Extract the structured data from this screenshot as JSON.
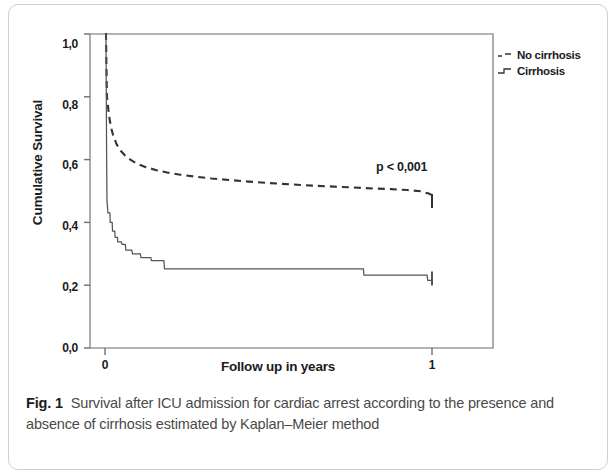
{
  "figure": {
    "label": "Fig. 1",
    "caption": "Survival after ICU admission for cardiac arrest according to the presence and absence of cirrhosis estimated by Kaplan–Meier method"
  },
  "annotation": {
    "p_value": "p < 0,001"
  },
  "legend": {
    "items": [
      {
        "label": "No cirrhosis",
        "style": "dashed"
      },
      {
        "label": "Cirrhosis",
        "style": "step"
      }
    ]
  },
  "axis": {
    "y_ticks": [
      "1,0",
      "0,8",
      "0,6",
      "0,4",
      "0,2",
      "0,0"
    ],
    "x_ticks": [
      "0",
      "1"
    ]
  },
  "chart_data": {
    "type": "line",
    "title": "",
    "subtitle": "",
    "xlabel": "Follow up in years",
    "ylabel": "Cumulative Survival",
    "xlim": [
      0,
      1.185
    ],
    "ylim": [
      0,
      1.0
    ],
    "xtick_values": [
      0,
      1
    ],
    "xtick_labels": [
      "0",
      "1"
    ],
    "ytick_values": [
      0.0,
      0.2,
      0.4,
      0.6,
      0.8,
      1.0
    ],
    "ytick_labels": [
      "0,0",
      "0,2",
      "0,4",
      "0,6",
      "0,8",
      "1,0"
    ],
    "grid": false,
    "legend_position": "right-outside",
    "annotations": [
      {
        "text": "p < 0,001",
        "x": 0.83,
        "y": 0.565
      }
    ],
    "series": [
      {
        "name": "No cirrhosis",
        "style": "dashed",
        "color": "#333333",
        "censor_marks": [
          {
            "x": 1.0,
            "y": 0.462
          }
        ],
        "points": [
          [
            0.0,
            1.0
          ],
          [
            0.003,
            1.0
          ],
          [
            0.004,
            0.93
          ],
          [
            0.005,
            0.86
          ],
          [
            0.006,
            0.8
          ],
          [
            0.008,
            0.782
          ],
          [
            0.012,
            0.742
          ],
          [
            0.018,
            0.705
          ],
          [
            0.026,
            0.673
          ],
          [
            0.036,
            0.648
          ],
          [
            0.048,
            0.628
          ],
          [
            0.062,
            0.612
          ],
          [
            0.08,
            0.598
          ],
          [
            0.1,
            0.586
          ],
          [
            0.125,
            0.576
          ],
          [
            0.155,
            0.567
          ],
          [
            0.19,
            0.559
          ],
          [
            0.23,
            0.552
          ],
          [
            0.275,
            0.546
          ],
          [
            0.325,
            0.54
          ],
          [
            0.38,
            0.535
          ],
          [
            0.44,
            0.53
          ],
          [
            0.505,
            0.525
          ],
          [
            0.57,
            0.521
          ],
          [
            0.635,
            0.517
          ],
          [
            0.7,
            0.514
          ],
          [
            0.76,
            0.511
          ],
          [
            0.82,
            0.508
          ],
          [
            0.875,
            0.506
          ],
          [
            0.925,
            0.503
          ],
          [
            0.965,
            0.499
          ],
          [
            0.99,
            0.492
          ],
          [
            1.0,
            0.487
          ]
        ]
      },
      {
        "name": "Cirrhosis",
        "style": "step",
        "color": "#555555",
        "censor_marks": [
          {
            "x": 1.0,
            "y": 0.215
          }
        ],
        "points": [
          [
            0.0,
            1.0
          ],
          [
            0.003,
            1.0
          ],
          [
            0.004,
            0.8
          ],
          [
            0.005,
            0.6
          ],
          [
            0.006,
            0.47
          ],
          [
            0.009,
            0.43
          ],
          [
            0.015,
            0.43
          ],
          [
            0.016,
            0.4
          ],
          [
            0.022,
            0.4
          ],
          [
            0.023,
            0.372
          ],
          [
            0.03,
            0.372
          ],
          [
            0.031,
            0.352
          ],
          [
            0.038,
            0.352
          ],
          [
            0.039,
            0.338
          ],
          [
            0.05,
            0.338
          ],
          [
            0.052,
            0.33
          ],
          [
            0.062,
            0.33
          ],
          [
            0.064,
            0.312
          ],
          [
            0.082,
            0.312
          ],
          [
            0.084,
            0.3
          ],
          [
            0.108,
            0.3
          ],
          [
            0.11,
            0.288
          ],
          [
            0.14,
            0.288
          ],
          [
            0.142,
            0.278
          ],
          [
            0.18,
            0.278
          ],
          [
            0.182,
            0.252
          ],
          [
            0.79,
            0.252
          ],
          [
            0.792,
            0.232
          ],
          [
            0.985,
            0.232
          ],
          [
            0.987,
            0.215
          ],
          [
            1.0,
            0.215
          ]
        ]
      }
    ]
  }
}
